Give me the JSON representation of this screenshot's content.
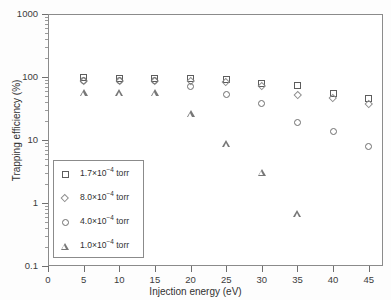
{
  "chart_data": {
    "type": "scatter",
    "title": "",
    "xlabel": "Injection energy (eV)",
    "ylabel": "Trapping efficiency (%)",
    "xlim": [
      0,
      47
    ],
    "ylim": [
      0.1,
      1000
    ],
    "yscale": "log",
    "xticks": [
      0,
      5,
      10,
      15,
      20,
      25,
      30,
      35,
      40,
      45
    ],
    "xticklabels": [
      "0",
      "5",
      "10",
      "15",
      "20",
      "25",
      "30",
      "35",
      "40",
      "45"
    ],
    "yticks": [
      0.1,
      1,
      10,
      100,
      1000
    ],
    "yticklabels": [
      "0.1",
      "1",
      "10",
      "100",
      "1000"
    ],
    "grid": false,
    "legend_position": "lower left",
    "x": [
      5,
      10,
      15,
      20,
      25,
      30,
      35,
      40,
      45
    ],
    "series": [
      {
        "name": "1.7×10⁻⁴ torr",
        "marker": "square",
        "label_mantissa": "1.7×10",
        "label_exponent": "−4",
        "label_unit": " torr",
        "values": [
          98,
          96,
          96,
          95,
          92,
          78,
          72,
          55,
          45
        ]
      },
      {
        "name": "8.0×10⁻⁴ torr",
        "marker": "diamond",
        "label_mantissa": "8.0×10",
        "label_exponent": "−4",
        "label_unit": " torr",
        "values": [
          86,
          88,
          88,
          88,
          85,
          72,
          53,
          47,
          38
        ]
      },
      {
        "name": "4.0×10⁻⁴ torr",
        "marker": "circle",
        "label_mantissa": "4.0×10",
        "label_exponent": "−4",
        "label_unit": " torr",
        "values": [
          88,
          88,
          88,
          70,
          52,
          38,
          19,
          13.5,
          7.8
        ]
      },
      {
        "name": "1.0×10⁻⁴ torr",
        "marker": "triangle",
        "label_mantissa": "1.0×10",
        "label_exponent": "−4",
        "label_unit": " torr",
        "values": [
          56,
          56,
          56,
          26,
          8.7,
          3.1,
          0.67,
          null,
          null
        ]
      }
    ]
  }
}
